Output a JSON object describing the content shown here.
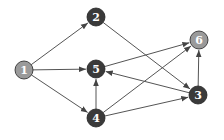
{
  "graph": {
    "directed": true,
    "nodes": [
      {
        "id": "1",
        "label": "1",
        "x": 24,
        "y": 70,
        "fill": "#9a9a9a"
      },
      {
        "id": "2",
        "label": "2",
        "x": 96,
        "y": 17,
        "fill": "#3a3a3a"
      },
      {
        "id": "5",
        "label": "5",
        "x": 96,
        "y": 69,
        "fill": "#3a3a3a"
      },
      {
        "id": "6",
        "label": "6",
        "x": 199,
        "y": 40,
        "fill": "#9a9a9a"
      },
      {
        "id": "3",
        "label": "3",
        "x": 198,
        "y": 95,
        "fill": "#3a3a3a"
      },
      {
        "id": "4",
        "label": "4",
        "x": 96,
        "y": 118,
        "fill": "#3a3a3a"
      }
    ],
    "edges": [
      {
        "from": "1",
        "to": "2"
      },
      {
        "from": "1",
        "to": "5"
      },
      {
        "from": "1",
        "to": "4"
      },
      {
        "from": "2",
        "to": "3"
      },
      {
        "from": "5",
        "to": "6"
      },
      {
        "from": "4",
        "to": "5"
      },
      {
        "from": "4",
        "to": "6"
      },
      {
        "from": "4",
        "to": "3"
      },
      {
        "from": "3",
        "to": "5"
      },
      {
        "from": "3",
        "to": "6"
      }
    ]
  }
}
